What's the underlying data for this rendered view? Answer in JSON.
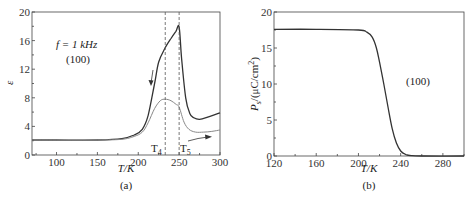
{
  "chart_data": [
    {
      "type": "line",
      "panel_label": "(a)",
      "title": "",
      "xlabel": "T/K",
      "ylabel": "ε",
      "xlim": [
        70,
        300
      ],
      "ylim": [
        0,
        20
      ],
      "xticks": [
        100,
        150,
        200,
        250,
        300
      ],
      "yticks": [
        0,
        4,
        8,
        12,
        16,
        20
      ],
      "grid": false,
      "annotations": {
        "frequency": "f = 1 kHz",
        "orientation": "(100)",
        "T4_label": "T",
        "T4_sub": "4",
        "T5_label": "T",
        "T5_sub": "5",
        "T4_value": 233,
        "T5_value": 250
      },
      "series": [
        {
          "name": "cooling (upper curve)",
          "color": "#333333",
          "x": [
            70,
            100,
            150,
            180,
            195,
            205,
            212,
            220,
            225,
            233,
            240,
            246,
            250,
            253,
            258,
            263,
            268,
            275,
            285,
            300
          ],
          "y": [
            2.1,
            2.1,
            2.1,
            2.3,
            2.8,
            3.6,
            5.5,
            10.0,
            13.0,
            15.0,
            16.3,
            17.3,
            17.9,
            13.5,
            8.0,
            5.8,
            5.2,
            5.0,
            5.3,
            5.9
          ]
        },
        {
          "name": "heating (lower curve)",
          "color": "#888888",
          "x": [
            70,
            100,
            150,
            180,
            195,
            205,
            212,
            220,
            227,
            233,
            240,
            246,
            250,
            256,
            262,
            270,
            280,
            290,
            300
          ],
          "y": [
            2.1,
            2.1,
            2.1,
            2.2,
            2.6,
            3.2,
            4.5,
            6.5,
            7.6,
            7.8,
            7.6,
            7.1,
            6.7,
            4.6,
            3.6,
            3.2,
            3.2,
            3.3,
            3.5
          ]
        }
      ]
    },
    {
      "type": "line",
      "panel_label": "(b)",
      "title": "",
      "xlabel": "T/K",
      "ylabel": "P_s/(μC/cm²)",
      "ylabel_parts": {
        "P": "P",
        "sub": "s",
        "unit": "/(μC/cm",
        "sup": "2",
        "close": ")"
      },
      "xlim": [
        120,
        300
      ],
      "ylim": [
        0,
        20
      ],
      "xticks": [
        120,
        160,
        200,
        240,
        280
      ],
      "yticks": [
        0,
        5,
        10,
        15,
        20
      ],
      "grid": false,
      "annotations": {
        "orientation": "(100)"
      },
      "series": [
        {
          "name": "Ps",
          "color": "#333333",
          "x": [
            120,
            160,
            200,
            208,
            213,
            217,
            220,
            224,
            228,
            232,
            236,
            240,
            245,
            250,
            260,
            300
          ],
          "y": [
            17.6,
            17.6,
            17.5,
            17.2,
            16.5,
            15.0,
            13.0,
            10.0,
            6.8,
            3.8,
            1.8,
            0.7,
            0.2,
            0.05,
            0.0,
            0.0
          ]
        }
      ]
    }
  ]
}
